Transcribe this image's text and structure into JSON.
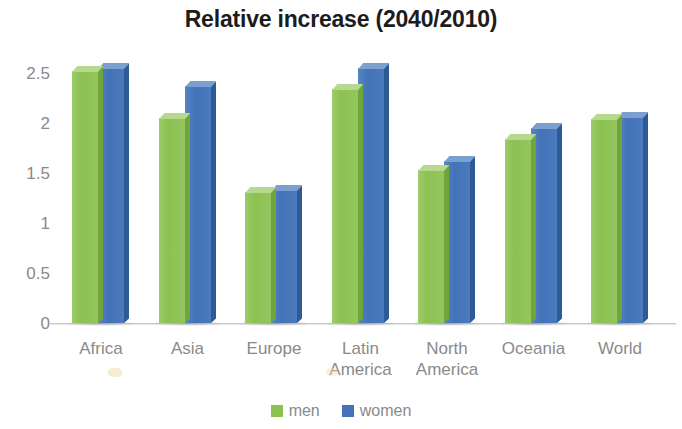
{
  "chart_data": {
    "type": "bar",
    "title": "Relative increase (2040/2010)",
    "xlabel": "",
    "ylabel": "",
    "ylim": [
      0,
      2.5
    ],
    "ytick_labels": [
      "2.5",
      "2",
      "1.5",
      "1",
      "0.5",
      "0"
    ],
    "ytick_values": [
      2.5,
      2,
      1.5,
      1,
      0.5,
      0
    ],
    "grid": false,
    "legend_position": "bottom",
    "categories": [
      "Africa",
      "Asia",
      "Europe",
      "Latin America",
      "North America",
      "Oceania",
      "World"
    ],
    "category_lines": [
      [
        "Africa",
        ""
      ],
      [
        "Asia",
        ""
      ],
      [
        "Europe",
        ""
      ],
      [
        "Latin",
        "America"
      ],
      [
        "North",
        "America"
      ],
      [
        "Oceania",
        ""
      ],
      [
        "World",
        ""
      ]
    ],
    "series": [
      {
        "name": "men",
        "color": "#8dc152",
        "values": [
          2.52,
          2.05,
          1.31,
          2.34,
          1.53,
          1.84,
          2.04
        ]
      },
      {
        "name": "women",
        "color": "#4472b8",
        "values": [
          2.55,
          2.37,
          1.33,
          2.55,
          1.62,
          1.95,
          2.06
        ]
      }
    ]
  },
  "legend": {
    "items": [
      {
        "label": "men",
        "color": "#8dc152"
      },
      {
        "label": "women",
        "color": "#4472b8"
      }
    ]
  }
}
